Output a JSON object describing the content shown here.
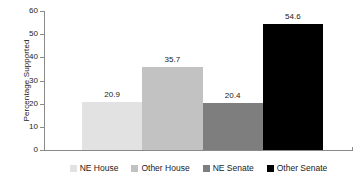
{
  "chart_data": {
    "type": "bar",
    "title": "",
    "subtitle": "",
    "xlabel": "",
    "ylabel": "Percentage Supported",
    "categories": [
      "NE House",
      "Other House",
      "NE Senate",
      "Other Senate"
    ],
    "values": [
      20.9,
      35.7,
      20.4,
      54.6
    ],
    "value_labels": [
      "20.9",
      "35.7",
      "20.4",
      "54.6"
    ],
    "colors": [
      "#E2E2E2",
      "#C2C2C2",
      "#7E7E7E",
      "#000000"
    ],
    "ylim": [
      0,
      60
    ],
    "ytick_values": [
      0,
      10,
      20,
      30,
      40,
      50,
      60
    ],
    "ytick_labels": [
      "0",
      "10",
      "20",
      "30",
      "40",
      "50",
      "60"
    ],
    "grid": false,
    "legend_position": "bottom",
    "legend": [
      {
        "label": "NE House",
        "color": "#E2E2E2"
      },
      {
        "label": "Other House",
        "color": "#C2C2C2"
      },
      {
        "label": "NE Senate",
        "color": "#7E7E7E"
      },
      {
        "label": "Other Senate",
        "color": "#000000"
      }
    ],
    "axis_color": "#8A8A8A",
    "text_color": "#1A1A1A",
    "background": "#FFFFFF"
  }
}
